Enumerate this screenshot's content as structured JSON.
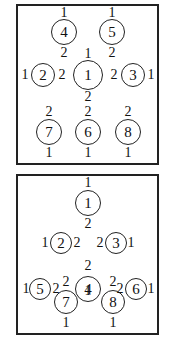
{
  "panels": [
    {
      "name": "top",
      "nodes": [
        {
          "id": "4",
          "x": 64,
          "y": 32,
          "r": 13
        },
        {
          "id": "5",
          "x": 112,
          "y": 32,
          "r": 13
        },
        {
          "id": "2",
          "x": 43,
          "y": 75,
          "r": 12
        },
        {
          "id": "1",
          "x": 88,
          "y": 75,
          "r": 15
        },
        {
          "id": "3",
          "x": 133,
          "y": 75,
          "r": 12
        },
        {
          "id": "7",
          "x": 49,
          "y": 132,
          "r": 13
        },
        {
          "id": "6",
          "x": 88,
          "y": 132,
          "r": 13
        },
        {
          "id": "8",
          "x": 128,
          "y": 132,
          "r": 13
        }
      ],
      "labels": [
        {
          "t": "1",
          "x": 64,
          "y": 13
        },
        {
          "t": "1",
          "x": 112,
          "y": 13
        },
        {
          "t": "2",
          "x": 64,
          "y": 53
        },
        {
          "t": "2",
          "x": 112,
          "y": 53
        },
        {
          "t": "1",
          "x": 88,
          "y": 54
        },
        {
          "t": "1",
          "x": 25,
          "y": 75
        },
        {
          "t": "2",
          "x": 62,
          "y": 75
        },
        {
          "t": "2",
          "x": 114,
          "y": 75
        },
        {
          "t": "1",
          "x": 151,
          "y": 75
        },
        {
          "t": "2",
          "x": 88,
          "y": 97
        },
        {
          "t": "2",
          "x": 49,
          "y": 112
        },
        {
          "t": "2",
          "x": 88,
          "y": 112
        },
        {
          "t": "2",
          "x": 128,
          "y": 112
        },
        {
          "t": "1",
          "x": 49,
          "y": 153
        },
        {
          "t": "1",
          "x": 88,
          "y": 153
        },
        {
          "t": "1",
          "x": 128,
          "y": 153
        }
      ]
    },
    {
      "name": "bottom",
      "nodes": [
        {
          "id": "1",
          "x": 88,
          "y": 203,
          "r": 13
        },
        {
          "id": "2",
          "x": 61,
          "y": 243,
          "r": 11
        },
        {
          "id": "3",
          "x": 116,
          "y": 243,
          "r": 11
        },
        {
          "id": "5",
          "x": 40,
          "y": 289,
          "r": 11
        },
        {
          "id": "4",
          "x": 88,
          "y": 289,
          "r": 13
        },
        {
          "id": "6",
          "x": 136,
          "y": 289,
          "r": 11
        },
        {
          "id": "7",
          "x": 66,
          "y": 302,
          "r": 12
        },
        {
          "id": "8",
          "x": 113,
          "y": 302,
          "r": 12
        }
      ],
      "labels": [
        {
          "t": "1",
          "x": 88,
          "y": 183
        },
        {
          "t": "2",
          "x": 88,
          "y": 224
        },
        {
          "t": "1",
          "x": 45,
          "y": 243
        },
        {
          "t": "2",
          "x": 77,
          "y": 243
        },
        {
          "t": "2",
          "x": 100,
          "y": 243
        },
        {
          "t": "1",
          "x": 131,
          "y": 243
        },
        {
          "t": "2",
          "x": 88,
          "y": 266
        },
        {
          "t": "1",
          "x": 26,
          "y": 289
        },
        {
          "t": "2",
          "x": 56,
          "y": 289
        },
        {
          "t": "2",
          "x": 120,
          "y": 289
        },
        {
          "t": "1",
          "x": 151,
          "y": 289
        },
        {
          "t": "2",
          "x": 66,
          "y": 282
        },
        {
          "t": "1",
          "x": 88,
          "y": 291
        },
        {
          "t": "2",
          "x": 113,
          "y": 282
        },
        {
          "t": "1",
          "x": 66,
          "y": 323
        },
        {
          "t": "1",
          "x": 113,
          "y": 323
        }
      ]
    }
  ]
}
